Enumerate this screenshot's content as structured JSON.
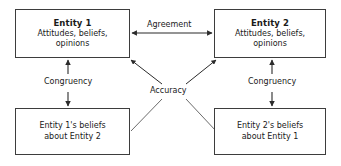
{
  "diagram": {
    "type": "relationship-diagram",
    "nodes": [
      {
        "id": "entity1",
        "title": "Entity 1",
        "line1": "Attitudes, beliefs,",
        "line2": "opinions",
        "position": "top-left"
      },
      {
        "id": "entity2",
        "title": "Entity 2",
        "line1": "Attitudes, beliefs,",
        "line2": "opinions",
        "position": "top-right"
      },
      {
        "id": "beliefs1",
        "line1": "Entity 1's beliefs",
        "line2": "about Entity 2",
        "position": "bottom-left"
      },
      {
        "id": "beliefs2",
        "line1": "Entity 2's beliefs",
        "line2": "about Entity 1",
        "position": "bottom-right"
      }
    ],
    "edges": [
      {
        "id": "agreement",
        "label": "Agreement",
        "from": "entity1",
        "to": "entity2",
        "style": "double-headed-horizontal"
      },
      {
        "id": "congruency-left",
        "label": "Congruency",
        "from": "entity1",
        "to": "beliefs1",
        "style": "two-opposed-vertical-arrows"
      },
      {
        "id": "congruency-right",
        "label": "Congruency",
        "from": "entity2",
        "to": "beliefs2",
        "style": "two-opposed-vertical-arrows"
      },
      {
        "id": "accuracy",
        "label": "Accuracy",
        "from": "beliefs1, beliefs2",
        "to": "entity1, entity2",
        "style": "crossing-diagonals-arrowheads-at-top"
      }
    ],
    "colors": {
      "box_border": "#3d3d3d",
      "arrow": "#2b2b2b",
      "text": "#1a1a1a",
      "background": "#ffffff"
    }
  }
}
